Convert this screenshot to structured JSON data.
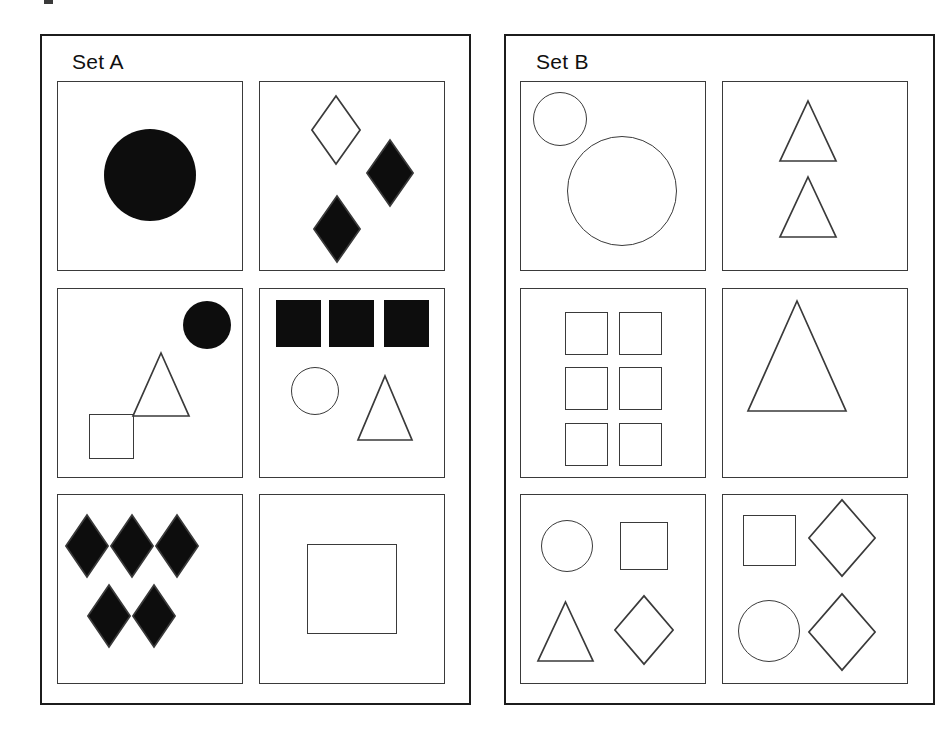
{
  "page": {
    "background_color": "#ffffff",
    "width": 817,
    "height": 732,
    "stroke_color": "#3a3a3a",
    "fill_color": "#0d0d0d",
    "panel_border_color": "#1c1c1c"
  },
  "panels": [
    {
      "id": "set-a",
      "title": "Set A",
      "x": 40,
      "y": 34,
      "w": 431,
      "h": 671,
      "title_x": 72,
      "title_y": 50,
      "columns": 2,
      "rows": 3,
      "clipped": false,
      "cells": [
        {
          "index": 1,
          "x": 57,
          "y": 81,
          "w": 186,
          "h": 190,
          "shape_count": 1,
          "shapes": [
            {
              "kind": "circle",
              "fill": "filled",
              "cx": 93,
              "cy": 94,
              "r": 46
            }
          ]
        },
        {
          "index": 2,
          "x": 259,
          "y": 81,
          "w": 186,
          "h": 190,
          "shape_count": 3,
          "shapes": [
            {
              "kind": "diamond",
              "fill": "outline",
              "cx": 77,
              "cy": 49,
              "rx": 25,
              "ry": 35
            },
            {
              "kind": "diamond",
              "fill": "filled",
              "cx": 131,
              "cy": 92,
              "rx": 24,
              "ry": 34
            },
            {
              "kind": "diamond",
              "fill": "filled",
              "cx": 78,
              "cy": 148,
              "rx": 24,
              "ry": 34
            }
          ]
        },
        {
          "index": 3,
          "x": 57,
          "y": 288,
          "w": 186,
          "h": 190,
          "shape_count": 3,
          "shapes": [
            {
              "kind": "circle",
              "fill": "filled",
              "cx": 150,
              "cy": 37,
              "r": 24
            },
            {
              "kind": "triangle",
              "fill": "outline",
              "cx": 104,
              "cy": 96,
              "w": 58,
              "h": 65
            },
            {
              "kind": "square",
              "fill": "outline",
              "cx": 54,
              "cy": 148,
              "w": 45,
              "h": 45
            }
          ]
        },
        {
          "index": 4,
          "x": 259,
          "y": 288,
          "w": 186,
          "h": 190,
          "shape_count": 5,
          "shapes": [
            {
              "kind": "square",
              "fill": "filled",
              "cx": 39,
              "cy": 35,
              "w": 45,
              "h": 47
            },
            {
              "kind": "square",
              "fill": "filled",
              "cx": 92,
              "cy": 35,
              "w": 45,
              "h": 47
            },
            {
              "kind": "square",
              "fill": "filled",
              "cx": 147,
              "cy": 35,
              "w": 45,
              "h": 47
            },
            {
              "kind": "circle",
              "fill": "outline",
              "cx": 56,
              "cy": 103,
              "r": 24
            },
            {
              "kind": "triangle",
              "fill": "outline",
              "cx": 126,
              "cy": 120,
              "w": 56,
              "h": 66
            }
          ]
        },
        {
          "index": 5,
          "x": 57,
          "y": 494,
          "w": 186,
          "h": 190,
          "shape_count": 5,
          "shapes": [
            {
              "kind": "diamond",
              "fill": "filled",
              "cx": 30,
              "cy": 52,
              "rx": 22,
              "ry": 32
            },
            {
              "kind": "diamond",
              "fill": "filled",
              "cx": 75,
              "cy": 52,
              "rx": 22,
              "ry": 32
            },
            {
              "kind": "diamond",
              "fill": "filled",
              "cx": 120,
              "cy": 52,
              "rx": 22,
              "ry": 32
            },
            {
              "kind": "diamond",
              "fill": "filled",
              "cx": 52,
              "cy": 122,
              "rx": 22,
              "ry": 32
            },
            {
              "kind": "diamond",
              "fill": "filled",
              "cx": 97,
              "cy": 122,
              "rx": 22,
              "ry": 32
            }
          ]
        },
        {
          "index": 6,
          "x": 259,
          "y": 494,
          "w": 186,
          "h": 190,
          "shape_count": 1,
          "shapes": [
            {
              "kind": "square",
              "fill": "outline",
              "cx": 93,
              "cy": 95,
              "w": 90,
              "h": 90
            }
          ]
        }
      ]
    },
    {
      "id": "set-b",
      "title": "Set B",
      "x": 504,
      "y": 34,
      "w": 431,
      "h": 671,
      "title_x": 536,
      "title_y": 50,
      "columns": 2,
      "rows": 3,
      "clipped": true,
      "cells": [
        {
          "index": 1,
          "x": 520,
          "y": 81,
          "w": 186,
          "h": 190,
          "shape_count": 2,
          "shapes": [
            {
              "kind": "circle",
              "fill": "outline",
              "cx": 40,
              "cy": 38,
              "r": 27
            },
            {
              "kind": "circle",
              "fill": "outline",
              "cx": 102,
              "cy": 110,
              "r": 55
            }
          ]
        },
        {
          "index": 2,
          "x": 722,
          "y": 81,
          "w": 186,
          "h": 190,
          "shape_count": 2,
          "shapes": [
            {
              "kind": "triangle",
              "fill": "outline",
              "cx": 86,
              "cy": 50,
              "w": 58,
              "h": 62
            },
            {
              "kind": "triangle",
              "fill": "outline",
              "cx": 86,
              "cy": 126,
              "w": 58,
              "h": 62
            }
          ]
        },
        {
          "index": 3,
          "x": 520,
          "y": 288,
          "w": 186,
          "h": 190,
          "shape_count": 6,
          "shapes": [
            {
              "kind": "square",
              "fill": "outline",
              "cx": 66,
              "cy": 45,
              "w": 43,
              "h": 43
            },
            {
              "kind": "square",
              "fill": "outline",
              "cx": 120,
              "cy": 45,
              "w": 43,
              "h": 43
            },
            {
              "kind": "square",
              "fill": "outline",
              "cx": 66,
              "cy": 100,
              "w": 43,
              "h": 43
            },
            {
              "kind": "square",
              "fill": "outline",
              "cx": 120,
              "cy": 100,
              "w": 43,
              "h": 43
            },
            {
              "kind": "square",
              "fill": "outline",
              "cx": 66,
              "cy": 156,
              "w": 43,
              "h": 43
            },
            {
              "kind": "square",
              "fill": "outline",
              "cx": 120,
              "cy": 156,
              "w": 43,
              "h": 43
            }
          ]
        },
        {
          "index": 4,
          "x": 722,
          "y": 288,
          "w": 186,
          "h": 190,
          "shape_count": 1,
          "shapes": [
            {
              "kind": "triangle",
              "fill": "outline",
              "cx": 75,
              "cy": 68,
              "w": 100,
              "h": 112
            }
          ]
        },
        {
          "index": 5,
          "x": 520,
          "y": 494,
          "w": 186,
          "h": 190,
          "shape_count": 4,
          "shapes": [
            {
              "kind": "circle",
              "fill": "outline",
              "cx": 47,
              "cy": 52,
              "r": 26
            },
            {
              "kind": "square",
              "fill": "outline",
              "cx": 124,
              "cy": 52,
              "w": 48,
              "h": 48
            },
            {
              "kind": "triangle",
              "fill": "outline",
              "cx": 45,
              "cy": 137,
              "w": 57,
              "h": 61
            },
            {
              "kind": "diamond",
              "fill": "outline",
              "cx": 124,
              "cy": 136,
              "rx": 30,
              "ry": 35
            }
          ]
        },
        {
          "index": 6,
          "x": 722,
          "y": 494,
          "w": 186,
          "h": 190,
          "shape_count": 4,
          "shapes": [
            {
              "kind": "square",
              "fill": "outline",
              "cx": 47,
              "cy": 46,
              "w": 53,
              "h": 51
            },
            {
              "kind": "diamond",
              "fill": "outline",
              "cx": 120,
              "cy": 44,
              "rx": 34,
              "ry": 39
            },
            {
              "kind": "circle",
              "fill": "outline",
              "cx": 47,
              "cy": 137,
              "r": 31
            },
            {
              "kind": "diamond",
              "fill": "outline",
              "cx": 120,
              "cy": 138,
              "rx": 34,
              "ry": 39
            }
          ]
        }
      ]
    }
  ]
}
